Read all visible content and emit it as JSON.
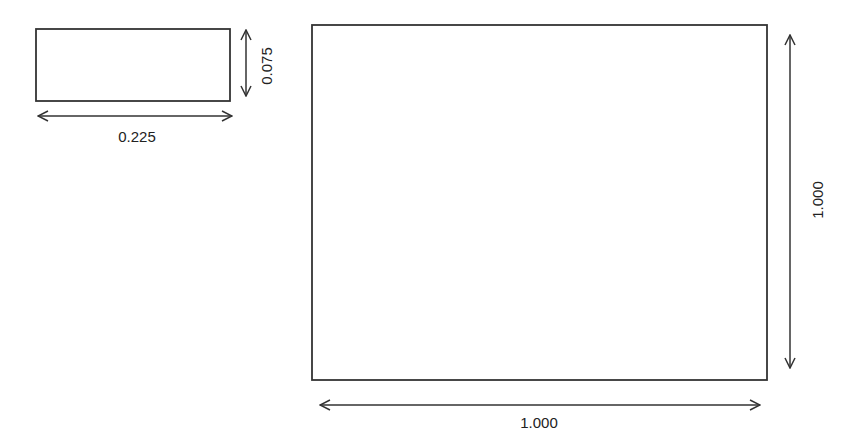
{
  "diagram": {
    "small_rect": {
      "width_label": "0.225",
      "height_label": "0.075"
    },
    "large_rect": {
      "width_label": "1.000",
      "height_label": "1.000"
    }
  },
  "colors": {
    "stroke": "#333333",
    "background": "#ffffff"
  }
}
